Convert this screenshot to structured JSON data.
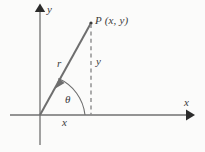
{
  "figure": {
    "type": "diagram",
    "background_color": "#fbfbfa",
    "line_color": "#6e6e6e",
    "axis_color": "#707070",
    "arrowhead_color": "#2b2b2b",
    "label_color": "#3a3a3a",
    "labels": {
      "y_axis": "y",
      "x_axis": "x",
      "point": "P (x, y)",
      "radius": "r",
      "vertical_leg": "y",
      "horizontal_leg": "x",
      "angle": "θ"
    },
    "geometry": {
      "origin": [
        40,
        115
      ],
      "point_p": [
        91,
        23
      ],
      "x_axis_start": [
        10,
        115
      ],
      "x_axis_end": [
        193,
        115
      ],
      "y_axis_top": [
        40,
        6
      ],
      "y_axis_bottom": [
        40,
        145
      ],
      "foot_of_perpendicular": [
        91,
        115
      ],
      "angle_arc_radius": 45
    }
  }
}
